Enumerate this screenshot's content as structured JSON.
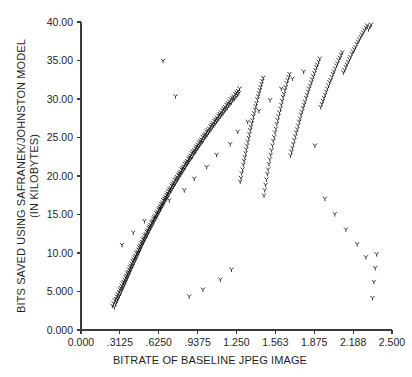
{
  "chart_data": {
    "type": "scatter",
    "title": "",
    "xlabel": "BITRATE OF BASELINE JPEG IMAGE",
    "ylabel_line1": "BITS SAVED USING SAFRANEK/JOHNSTON MODEL",
    "ylabel_line2": "(IN KILOBYTES)",
    "xlim": [
      0.0,
      2.5
    ],
    "ylim": [
      0.0,
      40.0
    ],
    "grid": false,
    "legend": null,
    "marker_style": "y-glyph",
    "marker_color": "#111111",
    "xticks": [
      0.0,
      0.3125,
      0.625,
      0.9375,
      1.25,
      1.5625,
      1.875,
      2.1875,
      2.5
    ],
    "xticklabels": [
      "0.000",
      ".3125",
      ".6250",
      ".9375",
      "1.250",
      "1.563",
      "1.875",
      "2.188",
      "2.500"
    ],
    "yticks": [
      0.0,
      5.0,
      10.0,
      15.0,
      20.0,
      25.0,
      30.0,
      35.0,
      40.0
    ],
    "yticklabels": [
      "0.000",
      "5.000",
      "10.00",
      "15.00",
      "20.00",
      "25.00",
      "30.00",
      "35.00",
      "40.00"
    ],
    "relationship": "strong positive linear, y = 16.2x - 1.7",
    "n_points": 402,
    "x": [
      0.252,
      0.262,
      0.268,
      0.271,
      0.278,
      0.281,
      0.286,
      0.289,
      0.294,
      0.296,
      0.301,
      0.305,
      0.309,
      0.313,
      0.317,
      0.321,
      0.324,
      0.328,
      0.332,
      0.336,
      0.339,
      0.343,
      0.347,
      0.351,
      0.354,
      0.358,
      0.361,
      0.365,
      0.369,
      0.372,
      0.376,
      0.379,
      0.383,
      0.387,
      0.39,
      0.394,
      0.397,
      0.401,
      0.405,
      0.408,
      0.412,
      0.416,
      0.419,
      0.423,
      0.427,
      0.431,
      0.434,
      0.438,
      0.442,
      0.446,
      0.449,
      0.453,
      0.457,
      0.461,
      0.464,
      0.468,
      0.472,
      0.476,
      0.479,
      0.483,
      0.487,
      0.491,
      0.494,
      0.498,
      0.502,
      0.506,
      0.51,
      0.513,
      0.517,
      0.521,
      0.525,
      0.529,
      0.532,
      0.536,
      0.54,
      0.544,
      0.548,
      0.551,
      0.555,
      0.559,
      0.563,
      0.567,
      0.571,
      0.574,
      0.578,
      0.582,
      0.586,
      0.59,
      0.594,
      0.598,
      0.602,
      0.606,
      0.61,
      0.614,
      0.618,
      0.622,
      0.626,
      0.63,
      0.634,
      0.638,
      0.642,
      0.646,
      0.65,
      0.654,
      0.658,
      0.662,
      0.666,
      0.67,
      0.674,
      0.678,
      0.683,
      0.687,
      0.691,
      0.695,
      0.699,
      0.703,
      0.708,
      0.712,
      0.716,
      0.72,
      0.725,
      0.729,
      0.733,
      0.737,
      0.742,
      0.746,
      0.75,
      0.755,
      0.759,
      0.763,
      0.768,
      0.772,
      0.777,
      0.781,
      0.785,
      0.79,
      0.794,
      0.799,
      0.803,
      0.808,
      0.812,
      0.817,
      0.821,
      0.826,
      0.83,
      0.835,
      0.84,
      0.844,
      0.849,
      0.853,
      0.858,
      0.863,
      0.867,
      0.872,
      0.877,
      0.881,
      0.886,
      0.891,
      0.896,
      0.9,
      0.905,
      0.91,
      0.915,
      0.92,
      0.924,
      0.929,
      0.934,
      0.939,
      0.944,
      0.949,
      0.954,
      0.959,
      0.964,
      0.969,
      0.974,
      0.979,
      0.984,
      0.989,
      0.994,
      0.999,
      1.004,
      1.009,
      1.014,
      1.019,
      1.025,
      1.03,
      1.035,
      1.04,
      1.045,
      1.051,
      1.056,
      1.061,
      1.066,
      1.072,
      1.077,
      1.082,
      1.088,
      1.093,
      1.098,
      1.104,
      1.109,
      1.115,
      1.12,
      1.126,
      1.131,
      1.137,
      1.142,
      1.148,
      1.153,
      1.159,
      1.164,
      1.17,
      1.176,
      1.181,
      1.187,
      1.193,
      1.198,
      1.204,
      1.21,
      1.216,
      1.221,
      1.227,
      1.233,
      1.239,
      1.245,
      1.251,
      1.257,
      1.263,
      1.268,
      1.274,
      1.28,
      1.286,
      1.292,
      1.299,
      1.305,
      1.311,
      1.317,
      1.323,
      1.329,
      1.335,
      1.342,
      1.348,
      1.354,
      1.36,
      1.367,
      1.373,
      1.379,
      1.386,
      1.392,
      1.399,
      1.405,
      1.411,
      1.418,
      1.424,
      1.431,
      1.438,
      1.444,
      1.451,
      1.457,
      1.464,
      1.471,
      1.477,
      1.484,
      1.491,
      1.498,
      1.504,
      1.511,
      1.518,
      1.525,
      1.532,
      1.539,
      1.546,
      1.553,
      1.56,
      1.567,
      1.574,
      1.581,
      1.588,
      1.595,
      1.603,
      1.61,
      1.617,
      1.624,
      1.632,
      1.639,
      1.647,
      1.654,
      1.661,
      1.669,
      1.676,
      1.684,
      1.692,
      1.699,
      1.707,
      1.715,
      1.722,
      1.73,
      1.738,
      1.746,
      1.754,
      1.761,
      1.769,
      1.777,
      1.785,
      1.793,
      1.801,
      1.81,
      1.818,
      1.826,
      1.834,
      1.842,
      1.851,
      1.859,
      1.867,
      1.876,
      1.884,
      1.893,
      1.901,
      1.91,
      1.919,
      1.927,
      1.936,
      1.945,
      1.953,
      1.962,
      1.971,
      1.98,
      1.989,
      1.998,
      2.007,
      2.016,
      2.025,
      2.034,
      2.043,
      2.053,
      2.062,
      2.071,
      2.081,
      2.09,
      2.1,
      2.109,
      2.119,
      2.128,
      2.138,
      2.148,
      2.158,
      2.167,
      2.177,
      2.187,
      2.197,
      2.207,
      2.217,
      2.227,
      2.238,
      2.248,
      2.258,
      2.269,
      2.279,
      2.29,
      2.3,
      2.311,
      2.321,
      2.332,
      2.343,
      2.354,
      2.365,
      2.376,
      0.33,
      0.42,
      0.51,
      0.64,
      0.71,
      0.83,
      0.91,
      1.01,
      1.09,
      1.2,
      1.26,
      1.34,
      1.43,
      1.52,
      1.61,
      1.7,
      1.79,
      1.88,
      1.96,
      2.04,
      2.13,
      2.22,
      2.29,
      1.21,
      1.12,
      0.98,
      0.87,
      0.76,
      0.66,
      0.56,
      0.47,
      0.38,
      0.31,
      1.69,
      1.96
    ],
    "y": [
      3.1,
      3.4,
      2.9,
      3.8,
      3.3,
      4.0,
      3.6,
      4.3,
      3.9,
      4.6,
      4.2,
      4.9,
      4.4,
      5.2,
      4.7,
      5.4,
      5.0,
      5.7,
      5.3,
      6.0,
      5.5,
      6.2,
      5.8,
      6.5,
      6.1,
      6.8,
      6.3,
      7.0,
      6.6,
      7.3,
      6.9,
      7.5,
      7.1,
      7.8,
      7.4,
      8.1,
      7.7,
      8.3,
      7.9,
      8.6,
      8.2,
      8.9,
      8.4,
      9.1,
      8.7,
      9.4,
      9.0,
      9.6,
      9.2,
      9.9,
      9.5,
      10.1,
      9.8,
      10.4,
      10.0,
      10.7,
      10.3,
      10.9,
      10.5,
      11.2,
      10.8,
      11.4,
      11.1,
      11.7,
      11.3,
      11.9,
      11.6,
      12.2,
      11.8,
      12.4,
      12.1,
      12.7,
      12.3,
      12.9,
      12.6,
      13.2,
      12.8,
      13.4,
      13.1,
      13.6,
      13.3,
      13.9,
      13.5,
      14.1,
      13.8,
      14.4,
      14.0,
      14.6,
      14.3,
      14.8,
      14.5,
      15.1,
      14.7,
      15.3,
      15.0,
      15.6,
      15.2,
      15.8,
      15.5,
      16.0,
      15.7,
      16.3,
      16.0,
      16.5,
      16.2,
      16.8,
      16.4,
      17.0,
      16.7,
      17.2,
      16.9,
      17.5,
      17.1,
      17.7,
      17.4,
      18.0,
      17.6,
      18.2,
      17.9,
      18.4,
      18.1,
      18.7,
      18.3,
      18.9,
      18.6,
      19.1,
      18.8,
      19.4,
      19.0,
      19.6,
      19.3,
      19.8,
      19.5,
      20.1,
      19.7,
      20.3,
      20.0,
      20.5,
      20.2,
      20.8,
      20.4,
      21.0,
      20.7,
      21.2,
      20.9,
      21.5,
      21.1,
      21.7,
      21.4,
      21.9,
      21.6,
      22.2,
      21.8,
      22.4,
      22.1,
      22.6,
      22.3,
      22.9,
      22.5,
      23.1,
      22.8,
      23.3,
      23.0,
      23.6,
      23.2,
      23.8,
      23.5,
      24.0,
      23.7,
      24.3,
      23.9,
      24.5,
      24.2,
      24.7,
      24.4,
      25.0,
      24.6,
      25.2,
      24.9,
      25.4,
      25.1,
      25.7,
      25.3,
      25.9,
      25.6,
      26.1,
      25.8,
      26.4,
      26.0,
      26.6,
      26.3,
      26.8,
      26.5,
      27.1,
      26.7,
      27.3,
      27.0,
      27.5,
      27.2,
      27.8,
      27.4,
      28.0,
      27.7,
      28.2,
      27.9,
      28.5,
      28.1,
      28.7,
      28.4,
      28.9,
      28.6,
      29.2,
      28.8,
      29.4,
      29.1,
      29.6,
      29.3,
      29.9,
      29.5,
      30.1,
      29.8,
      30.3,
      30.0,
      30.6,
      30.2,
      30.8,
      30.5,
      31.0,
      30.7,
      31.3,
      19.2,
      19.7,
      20.3,
      20.8,
      21.4,
      21.9,
      22.4,
      22.9,
      23.4,
      23.9,
      24.4,
      24.9,
      25.4,
      25.9,
      26.3,
      26.8,
      27.2,
      27.7,
      28.1,
      28.6,
      29.0,
      29.4,
      29.9,
      30.3,
      30.7,
      31.1,
      31.5,
      31.9,
      32.3,
      32.7,
      17.4,
      18.1,
      18.8,
      19.5,
      20.2,
      20.8,
      21.5,
      22.1,
      22.7,
      23.3,
      23.9,
      24.5,
      25.0,
      25.6,
      26.1,
      26.7,
      27.2,
      27.7,
      28.2,
      28.7,
      29.2,
      29.7,
      30.2,
      30.6,
      31.1,
      31.5,
      32.0,
      32.4,
      32.8,
      33.2,
      22.6,
      23.1,
      23.6,
      24.1,
      24.6,
      25.1,
      25.6,
      26.0,
      26.5,
      27.0,
      27.4,
      27.9,
      28.3,
      28.8,
      29.2,
      29.6,
      30.1,
      30.5,
      30.9,
      31.3,
      31.7,
      32.1,
      32.5,
      32.9,
      33.3,
      33.7,
      34.1,
      34.4,
      34.8,
      35.2,
      28.9,
      29.3,
      29.7,
      30.1,
      30.5,
      30.9,
      31.3,
      31.7,
      32.1,
      32.4,
      32.8,
      33.2,
      33.5,
      33.9,
      34.3,
      34.6,
      35.0,
      35.3,
      35.7,
      36.0,
      33.4,
      33.7,
      34.1,
      34.4,
      34.8,
      35.1,
      35.4,
      35.8,
      36.1,
      36.4,
      36.7,
      37.1,
      37.4,
      37.7,
      38.0,
      38.3,
      38.6,
      38.9,
      39.2,
      39.5,
      39.0,
      39.3,
      39.6,
      4.1,
      6.2,
      8.0,
      9.8,
      11.0,
      12.6,
      14.1,
      15.7,
      16.8,
      18.1,
      19.6,
      21.1,
      22.7,
      24.1,
      25.7,
      27.0,
      28.4,
      29.8,
      31.3,
      32.6,
      33.5,
      23.9,
      17.0,
      15.0,
      13.0,
      11.1,
      9.4,
      7.8,
      6.5,
      5.2,
      4.3,
      30.3,
      34.9
    ]
  },
  "figure": {
    "axis_color": "#3a3a3a",
    "text_color": "#1f1f1f",
    "background": "#ffffff"
  }
}
